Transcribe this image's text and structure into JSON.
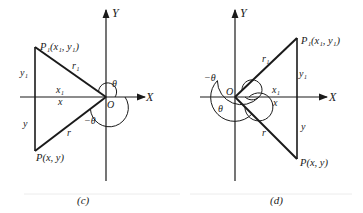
{
  "panels": [
    {
      "id": "c",
      "caption": "(c)",
      "axis_x_label": "X",
      "axis_y_label": "Y",
      "origin_label": "O",
      "point_p1": "P₁(x₁, y₁)",
      "point_p": "P(x, y)",
      "side_y1": "y₁",
      "side_y": "y",
      "side_x1": "x₁",
      "side_x": "x",
      "radius_r1": "r₁",
      "radius_r": "r",
      "angle_theta": "θ",
      "angle_neg_theta": "−θ"
    },
    {
      "id": "d",
      "caption": "(d)",
      "axis_x_label": "X",
      "axis_y_label": "Y",
      "origin_label": "O",
      "point_p1": "P₁(x₁, y₁)",
      "point_p": "P(x, y)",
      "side_y1": "y₁",
      "side_y": "y",
      "side_x1": "x₁",
      "side_x": "x",
      "radius_r1": "r₁",
      "radius_r": "r",
      "angle_theta": "θ",
      "angle_neg_theta": "−θ"
    }
  ]
}
